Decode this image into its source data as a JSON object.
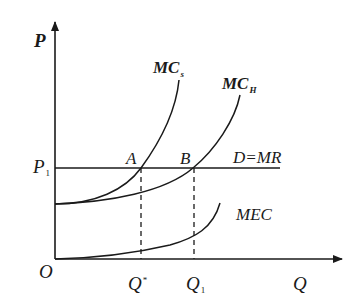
{
  "diagram": {
    "axes": {
      "y_label": "P",
      "x_label": "Q",
      "origin_label": "O"
    },
    "price_level": {
      "label": "P",
      "subscript": "1"
    },
    "curves": {
      "mcs": {
        "label": "MC",
        "subscript": "s"
      },
      "mch": {
        "label": "MC",
        "subscript": "H"
      },
      "demand": {
        "label": "D=MR"
      },
      "mec": {
        "label": "MEC"
      }
    },
    "points": {
      "a": {
        "label": "A"
      },
      "b": {
        "label": "B"
      }
    },
    "quantities": {
      "q_star": {
        "label": "Q",
        "superscript": "*"
      },
      "q1": {
        "label": "Q",
        "subscript": "1"
      }
    },
    "colors": {
      "line": "#1a1a1a",
      "background": "#ffffff"
    }
  }
}
